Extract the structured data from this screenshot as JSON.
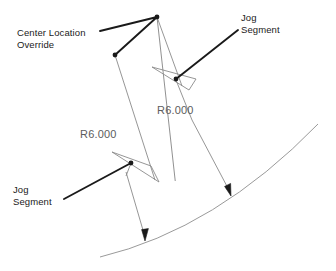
{
  "diagram": {
    "type": "cad-dimension-diagram",
    "labels": {
      "center_override": "Center Location\nOverride",
      "jog_segment_top": "Jog\nSegment",
      "jog_segment_bottom": "Jog\nSegment",
      "radius_upper": "R6.000",
      "radius_lower": "R6.000"
    },
    "colors": {
      "leader_dark": "#1a1a1a",
      "dimension_gray": "#8a8a8a",
      "arc_gray": "#9a9a9a",
      "text_dark": "#1a1a1a",
      "text_gray": "#5c5c5c",
      "background": "#ffffff"
    },
    "geometry": {
      "arc": {
        "start": [
          100,
          257
        ],
        "end": [
          318,
          124
        ],
        "control": [
          215,
          228
        ]
      },
      "override_vertex": [
        157,
        17
      ],
      "override_dot": [
        115,
        55
      ],
      "upper_jog_dot": [
        175,
        78
      ],
      "lower_jog_dot": [
        131,
        163
      ],
      "arc_arrow_left": [
        145,
        240
      ],
      "arc_arrow_right": [
        230,
        195
      ]
    }
  }
}
